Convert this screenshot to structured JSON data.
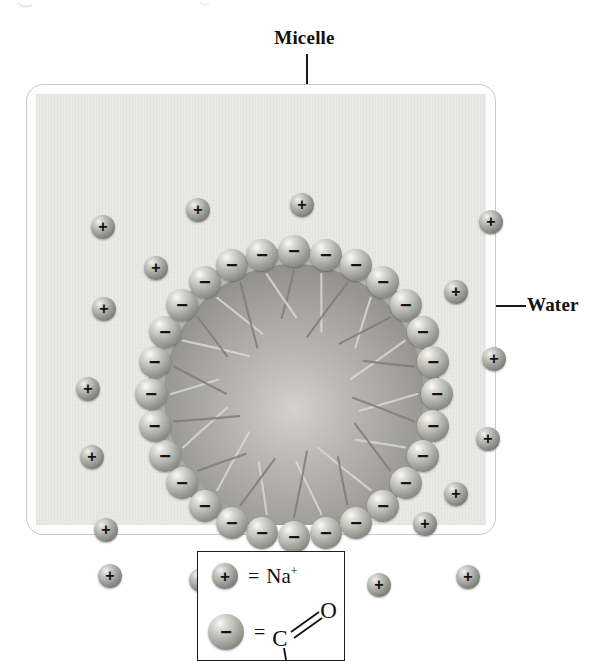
{
  "figure": {
    "kind": "micelle-diagram",
    "labels": {
      "micelle": "Micelle",
      "water": "Water"
    }
  },
  "legend": {
    "rows": [
      {
        "sphere_glyph": "+",
        "sphere_type": "sodium-ion",
        "equals": "=",
        "formula_text": "Na",
        "formula_superscript": "+"
      },
      {
        "sphere_glyph": "−",
        "sphere_type": "carboxylate-head",
        "equals": "=",
        "atom_carbon": "C",
        "atom_oxygen": "O",
        "bond": "double"
      }
    ]
  },
  "colors": {
    "page_background": "#ffffff",
    "water_panel": "#e9e9e6",
    "outer_box_border": "#c9c9c7",
    "legend_border": "#1d1d1d",
    "sphere_dark": "#62625f",
    "sphere_light": "#f2f2f0",
    "micelle_core": "#9d9d96",
    "text": "#111111"
  },
  "sodium_ions": [
    {
      "cx": 67,
      "cy": 133,
      "r": 12,
      "glyph": "+"
    },
    {
      "cx": 162,
      "cy": 116,
      "r": 12,
      "glyph": "+"
    },
    {
      "cx": 266,
      "cy": 111,
      "r": 12,
      "glyph": "+"
    },
    {
      "cx": 455,
      "cy": 128,
      "r": 12,
      "glyph": "+"
    },
    {
      "cx": 68,
      "cy": 215,
      "r": 12,
      "glyph": "+"
    },
    {
      "cx": 120,
      "cy": 174,
      "r": 12,
      "glyph": "+"
    },
    {
      "cx": 420,
      "cy": 198,
      "r": 12,
      "glyph": "+"
    },
    {
      "cx": 52,
      "cy": 295,
      "r": 12,
      "glyph": "+"
    },
    {
      "cx": 458,
      "cy": 265,
      "r": 12,
      "glyph": "+"
    },
    {
      "cx": 56,
      "cy": 363,
      "r": 12,
      "glyph": "+"
    },
    {
      "cx": 70,
      "cy": 436,
      "r": 12,
      "glyph": "+"
    },
    {
      "cx": 452,
      "cy": 345,
      "r": 12,
      "glyph": "+"
    },
    {
      "cx": 420,
      "cy": 400,
      "r": 12,
      "glyph": "+"
    },
    {
      "cx": 74,
      "cy": 482,
      "r": 12,
      "glyph": "+"
    },
    {
      "cx": 165,
      "cy": 486,
      "r": 12,
      "glyph": "+"
    },
    {
      "cx": 253,
      "cy": 497,
      "r": 12,
      "glyph": "+"
    },
    {
      "cx": 343,
      "cy": 491,
      "r": 12,
      "glyph": "+"
    },
    {
      "cx": 432,
      "cy": 483,
      "r": 12,
      "glyph": "+"
    },
    {
      "cx": 389,
      "cy": 430,
      "r": 12,
      "glyph": "+"
    }
  ],
  "micelle": {
    "center_x": 258,
    "center_y": 300,
    "core_radius": 130,
    "rim_radius": 143,
    "head_count": 28,
    "head_radius": 16,
    "tail_count": 28,
    "charge_glyph": "−"
  }
}
